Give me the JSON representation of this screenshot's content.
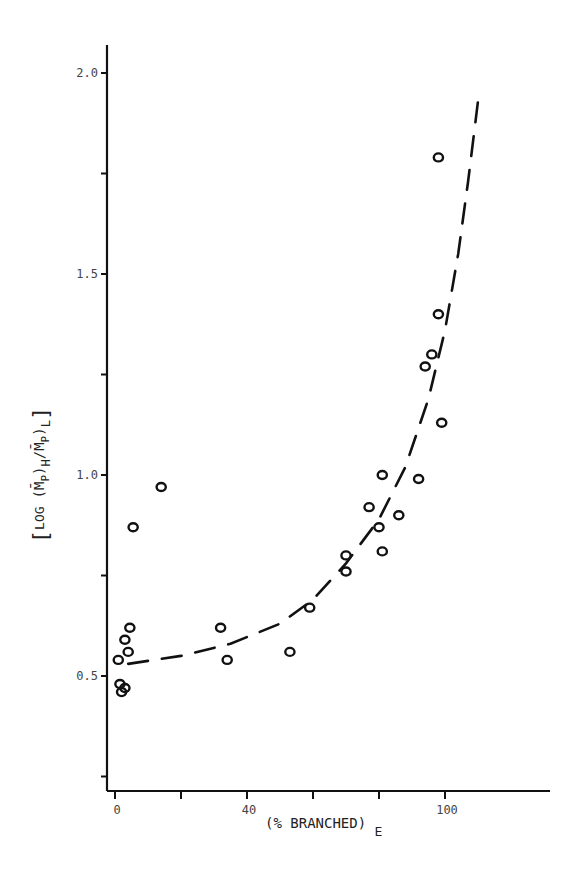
{
  "chart_data": {
    "type": "scatter",
    "title": "",
    "xlabel": "(% BRANCHED)",
    "xlabel_subscript": "E",
    "ylabel": "[LOG (M̄P)H/(M̄P)L]",
    "ylabel_parts": {
      "open_bracket": "[",
      "log": "LOG",
      "num": "(M̄",
      "num_sub": "P",
      "num_close": ")",
      "num_sub2": "H",
      "slash": "/",
      "den": "M̄",
      "den_sub": "P",
      "den_close": ")",
      "den_sub2": "L",
      "close_bracket": "]"
    },
    "xlim": [
      -3,
      133
    ],
    "ylim": [
      0.21,
      2.09
    ],
    "x_ticks": [
      0,
      20,
      40,
      60,
      80,
      100
    ],
    "x_tick_labels": [
      "0",
      "",
      "40",
      "",
      "",
      "100"
    ],
    "y_ticks": [
      0.25,
      0.5,
      0.75,
      1.0,
      1.25,
      1.5,
      1.75,
      2.0
    ],
    "y_tick_labels": [
      "",
      "0.5",
      "",
      "1.0",
      "",
      "1.5",
      "",
      "2.0"
    ],
    "grid": false,
    "legend": null,
    "series": [
      {
        "name": "observed",
        "marker": "open-circle",
        "points": [
          {
            "x": 14,
            "y": 0.97
          },
          {
            "x": 5.5,
            "y": 0.87
          },
          {
            "x": 4.5,
            "y": 0.62
          },
          {
            "x": 3,
            "y": 0.59
          },
          {
            "x": 4,
            "y": 0.56
          },
          {
            "x": 1,
            "y": 0.54
          },
          {
            "x": 1.5,
            "y": 0.48
          },
          {
            "x": 3,
            "y": 0.47
          },
          {
            "x": 2,
            "y": 0.46
          },
          {
            "x": 32,
            "y": 0.62
          },
          {
            "x": 34,
            "y": 0.54
          },
          {
            "x": 53,
            "y": 0.56
          },
          {
            "x": 59,
            "y": 0.67
          },
          {
            "x": 70,
            "y": 0.76
          },
          {
            "x": 70,
            "y": 0.8
          },
          {
            "x": 80,
            "y": 0.87
          },
          {
            "x": 81,
            "y": 0.81
          },
          {
            "x": 77,
            "y": 0.92
          },
          {
            "x": 81,
            "y": 1.0
          },
          {
            "x": 86,
            "y": 0.9
          },
          {
            "x": 92,
            "y": 0.99
          },
          {
            "x": 99,
            "y": 1.13
          },
          {
            "x": 94,
            "y": 1.27
          },
          {
            "x": 96,
            "y": 1.3
          },
          {
            "x": 98,
            "y": 1.4
          },
          {
            "x": 98,
            "y": 1.79
          }
        ]
      },
      {
        "name": "fitted-curve",
        "style": "dashed",
        "points": [
          {
            "x": 4,
            "y": 0.53
          },
          {
            "x": 20,
            "y": 0.55
          },
          {
            "x": 35,
            "y": 0.58
          },
          {
            "x": 50,
            "y": 0.63
          },
          {
            "x": 60,
            "y": 0.69
          },
          {
            "x": 70,
            "y": 0.78
          },
          {
            "x": 80,
            "y": 0.89
          },
          {
            "x": 88,
            "y": 1.02
          },
          {
            "x": 95,
            "y": 1.19
          },
          {
            "x": 100,
            "y": 1.36
          },
          {
            "x": 104,
            "y": 1.55
          },
          {
            "x": 107,
            "y": 1.73
          },
          {
            "x": 110,
            "y": 1.93
          }
        ]
      }
    ]
  }
}
